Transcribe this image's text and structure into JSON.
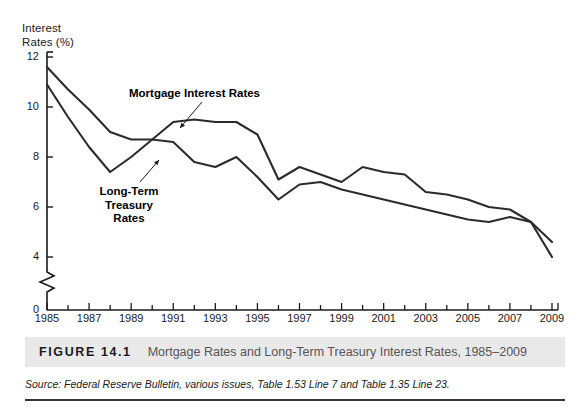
{
  "figure": {
    "number_label": "FIGURE 14.1",
    "caption": "Mortgage Rates and Long-Term Treasury Interest Rates, 1985–2009",
    "source": "Source: Federal Reserve Bulletin, various issues, Table 1.53 Line 7 and Table 1.35 Line 23."
  },
  "colors": {
    "line": "#2b2b2b",
    "axis": "#1a1a1a",
    "caption_band": "#e9e9e9",
    "caption_text": "#555555",
    "background": "#ffffff"
  },
  "annotations": {
    "mortgage_label": "Mortgage Interest Rates",
    "treasury_label": "Long-Term\nTreasury\nRates"
  },
  "chart_data": {
    "type": "line",
    "title": "Mortgage Rates and Long-Term Treasury Interest Rates, 1985–2009",
    "xlabel": "",
    "ylabel": "Interest\nRates (%)",
    "ylabel_line1": "Interest",
    "ylabel_line2": "Rates (%)",
    "grid": false,
    "legend": "inline-annotations",
    "axis_break": true,
    "axis_break_between": [
      0,
      4
    ],
    "xlim": [
      1985,
      2009
    ],
    "ylim": [
      4,
      12
    ],
    "y_ticks": [
      12,
      10,
      8,
      6,
      4
    ],
    "y_zero_tick": 0,
    "x_ticks": [
      1985,
      1987,
      1989,
      1991,
      1993,
      1995,
      1997,
      1999,
      2001,
      2003,
      2005,
      2007,
      2009
    ],
    "x_tick_labels": [
      "1985",
      "1987",
      "1989",
      "1991",
      "1993",
      "1995",
      "1997",
      "1999",
      "2001",
      "2003",
      "2005",
      "2007",
      "2009"
    ],
    "x_minor_ticks": [
      1986,
      1988,
      1990,
      1992,
      1994,
      1996,
      1998,
      2000,
      2002,
      2004,
      2006,
      2008
    ],
    "x": [
      1985,
      1986,
      1987,
      1988,
      1989,
      1990,
      1991,
      1992,
      1993,
      1994,
      1995,
      1996,
      1997,
      1998,
      1999,
      2000,
      2001,
      2002,
      2003,
      2004,
      2005,
      2006,
      2007,
      2008,
      2009
    ],
    "series": [
      {
        "name": "Mortgage Interest Rates",
        "values": [
          11.6,
          10.7,
          9.9,
          9.0,
          8.7,
          8.7,
          9.4,
          9.5,
          9.4,
          9.4,
          8.9,
          7.1,
          7.6,
          7.3,
          7.0,
          7.6,
          7.4,
          7.3,
          6.6,
          6.5,
          6.3,
          6.0,
          5.9,
          5.4,
          4.6
        ]
      },
      {
        "name": "Long-Term Treasury Rates",
        "values": [
          10.9,
          9.6,
          8.4,
          7.4,
          8.0,
          8.7,
          8.6,
          7.8,
          7.6,
          8.0,
          7.2,
          6.3,
          6.9,
          7.0,
          6.7,
          6.5,
          6.3,
          6.1,
          5.9,
          5.7,
          5.5,
          5.4,
          5.6,
          5.4,
          4.0
        ]
      }
    ]
  }
}
